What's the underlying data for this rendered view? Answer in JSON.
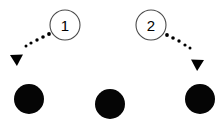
{
  "figure": {
    "kind": "motion-diagram",
    "background_color": "#ffffff",
    "ink_color": "#000000",
    "ring_stroke_color": "#4a4a4a",
    "width": 222,
    "height": 124
  },
  "steps": [
    {
      "id": "step-1",
      "label": "1",
      "marker": {
        "cx": 65,
        "cy": 25,
        "r": 15
      },
      "direction": "down-left",
      "trail": [
        {
          "cx": 49,
          "cy": 34,
          "r": 1.9
        },
        {
          "cx": 43,
          "cy": 37,
          "r": 1.8
        },
        {
          "cx": 37,
          "cy": 40,
          "r": 1.7
        },
        {
          "cx": 31,
          "cy": 43,
          "r": 1.6
        },
        {
          "cx": 26,
          "cy": 46,
          "r": 1.5
        }
      ],
      "arrow": {
        "tip_x": 10,
        "tip_y": 55,
        "angle_deg": 208,
        "size": 9
      }
    },
    {
      "id": "step-2",
      "label": "2",
      "marker": {
        "cx": 151,
        "cy": 25,
        "r": 15
      },
      "direction": "down-right",
      "trail": [
        {
          "cx": 167,
          "cy": 35,
          "r": 1.9
        },
        {
          "cx": 173,
          "cy": 38,
          "r": 1.8
        },
        {
          "cx": 179,
          "cy": 41,
          "r": 1.7
        },
        {
          "cx": 185,
          "cy": 45,
          "r": 1.6
        },
        {
          "cx": 190,
          "cy": 48,
          "r": 1.5
        }
      ],
      "arrow": {
        "tip_x": 204,
        "tip_y": 60,
        "angle_deg": 332,
        "size": 9
      }
    }
  ],
  "targets": [
    {
      "id": "target-left",
      "cx": 29,
      "cy": 99,
      "r": 15
    },
    {
      "id": "target-center",
      "cx": 110,
      "cy": 104,
      "r": 15
    },
    {
      "id": "target-right",
      "cx": 200,
      "cy": 99,
      "r": 15
    }
  ]
}
